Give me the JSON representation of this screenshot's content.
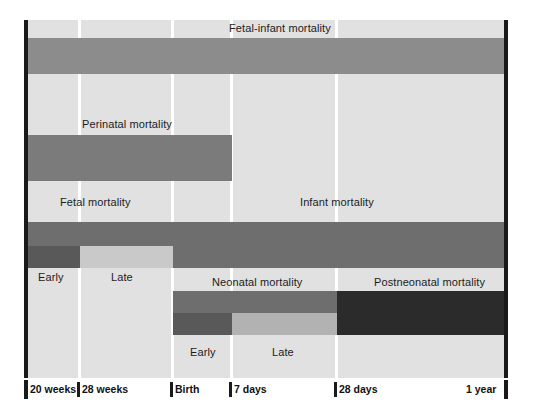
{
  "figure": {
    "title": "",
    "type": "timeline-diagram"
  },
  "axis": {
    "ticks": [
      {
        "id": "t20w",
        "label": "20 weeks",
        "x": 28
      },
      {
        "id": "t28w",
        "label": "28 weeks",
        "x": 80
      },
      {
        "id": "birth",
        "label": "Birth",
        "x": 173
      },
      {
        "id": "d7",
        "label": "7 days",
        "x": 232
      },
      {
        "id": "d28",
        "label": "28 days",
        "x": 337
      },
      {
        "id": "y1",
        "label": "1 year",
        "x": 504
      }
    ]
  },
  "colors": {
    "plot_background": "#e1e1e1",
    "gridline": "#ffffff",
    "bar_medium": "#8c8c8c",
    "bar_dark": "#6e6e6e",
    "bar_darker": "#595959",
    "bar_darkest": "#2b2b2b",
    "bar_light": "#c9c9c9",
    "axis_rule": "#1a1a1a",
    "text": "#1c1c1c"
  },
  "bands": {
    "fetal_infant": {
      "label": "Fetal-infant mortality",
      "from": "20 weeks",
      "to": "1 year",
      "x": 28,
      "width": 476,
      "y": 38,
      "height": 36,
      "color": "#8c8c8c",
      "label_x": 229,
      "label_y": 22
    },
    "perinatal": {
      "label": "Perinatal mortality",
      "from": "20 weeks",
      "to": "7 days",
      "x": 28,
      "width": 204,
      "y": 135,
      "height": 46,
      "color": "#7b7b7b",
      "label_x": 82,
      "label_y": 118
    },
    "fetal": {
      "label": "Fetal mortality",
      "from": "20 weeks",
      "to": "Birth",
      "x": 28,
      "width": 145,
      "y": 222,
      "height": 24,
      "color": "#6e6e6e",
      "label_x": 60,
      "label_y": 196
    },
    "fetal_early": {
      "label": "Early",
      "from": "20 weeks",
      "to": "28 weeks",
      "x": 28,
      "width": 52,
      "y": 246,
      "height": 22,
      "color": "#595959",
      "label_x": 38,
      "label_y": 271
    },
    "fetal_late": {
      "label": "Late",
      "from": "28 weeks",
      "to": "Birth",
      "x": 80,
      "width": 93,
      "y": 246,
      "height": 22,
      "color": "#c9c9c9",
      "label_x": 111,
      "label_y": 271
    },
    "infant": {
      "label": "Infant mortality",
      "from": "Birth",
      "to": "1 year",
      "x": 173,
      "width": 331,
      "y": 222,
      "height": 46,
      "color": "#6e6e6e",
      "label_x": 300,
      "label_y": 196
    },
    "neonatal": {
      "label": "Neonatal mortality",
      "from": "Birth",
      "to": "28 days",
      "x": 173,
      "width": 164,
      "y": 291,
      "height": 22,
      "color": "#6e6e6e",
      "label_x": 212,
      "label_y": 276
    },
    "neonatal_early": {
      "label": "Early",
      "from": "Birth",
      "to": "7 days",
      "x": 173,
      "width": 59,
      "y": 313,
      "height": 22,
      "color": "#595959",
      "label_x": 190,
      "label_y": 346
    },
    "neonatal_late": {
      "label": "Late",
      "from": "7 days",
      "to": "28 days",
      "x": 232,
      "width": 105,
      "y": 313,
      "height": 22,
      "color": "#b2b2b2",
      "label_x": 272,
      "label_y": 346
    },
    "postneonatal": {
      "label": "Postneonatal mortality",
      "from": "28 days",
      "to": "1 year",
      "x": 337,
      "width": 167,
      "y": 291,
      "height": 44,
      "color": "#2b2b2b",
      "label_x": 374,
      "label_y": 276
    }
  }
}
